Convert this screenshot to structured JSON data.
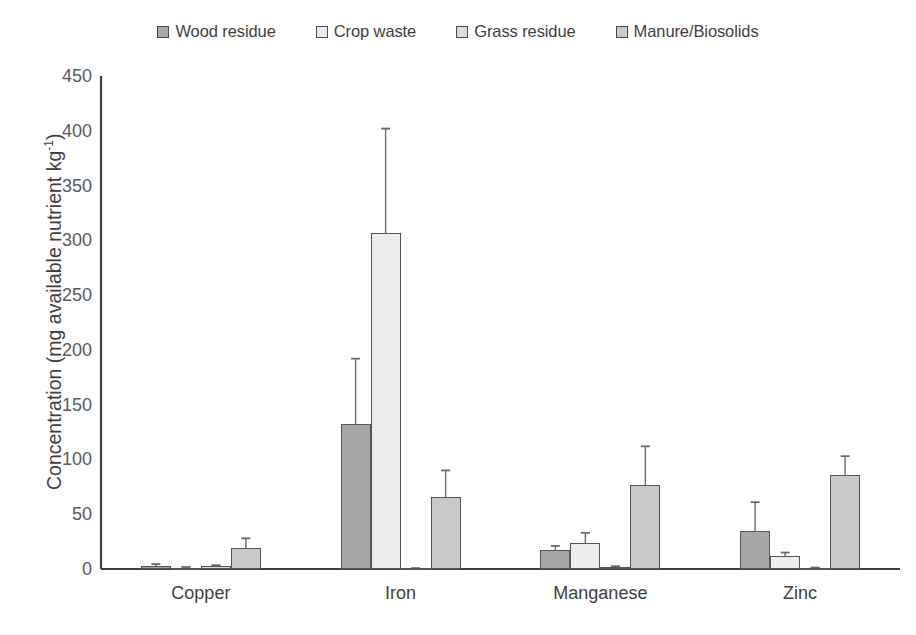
{
  "chart_data": {
    "type": "bar",
    "title": "",
    "subtitle": "",
    "xlabel": "",
    "ylabel": "Concentration (mg available nutrient kg-1)",
    "ylabel_base": "Concentration (mg available nutrient kg",
    "ylabel_sup": "-1",
    "ylabel_tail": ")",
    "categories": [
      "Copper",
      "Iron",
      "Manganese",
      "Zinc"
    ],
    "ylim": [
      0,
      450
    ],
    "yticks": [
      0,
      50,
      100,
      150,
      200,
      250,
      300,
      350,
      400,
      450
    ],
    "ytick_labels": [
      "0",
      "50",
      "100",
      "150",
      "200",
      "250",
      "300",
      "350",
      "400",
      "450"
    ],
    "grid": false,
    "legend_position": "top-center",
    "error_bars": "symmetric (standard deviation)",
    "series": [
      {
        "name": "Wood residue",
        "color": "#a6a6a6",
        "values": [
          3,
          132,
          17,
          35
        ],
        "errors": [
          1.5,
          60,
          4,
          26
        ]
      },
      {
        "name": "Crop waste",
        "color": "#ececec",
        "values": [
          1,
          307,
          24,
          12
        ],
        "errors": [
          0.8,
          95,
          9,
          3
        ]
      },
      {
        "name": "Grass residue",
        "color": "#dcdcdc",
        "values": [
          3,
          0.5,
          2,
          1
        ],
        "errors": [
          0.5,
          0.3,
          0.5,
          0.3
        ]
      },
      {
        "name": "Manure/Biosolids",
        "color": "#c9c9c9",
        "values": [
          19,
          66,
          77,
          86
        ],
        "errors": [
          9,
          24,
          35,
          17
        ]
      }
    ]
  },
  "legend": {
    "items": [
      {
        "label": "Wood residue",
        "color": "#a6a6a6"
      },
      {
        "label": "Crop waste",
        "color": "#ececec"
      },
      {
        "label": "Grass residue",
        "color": "#dcdcdc"
      },
      {
        "label": "Manure/Biosolids",
        "color": "#c9c9c9"
      }
    ]
  },
  "style": {
    "axis_color": "#404040",
    "bar_border_color": "#555555",
    "error_bar_color": "#6a6a6a",
    "tick_text_color": "#5a5a5a",
    "background": "#ffffff"
  }
}
